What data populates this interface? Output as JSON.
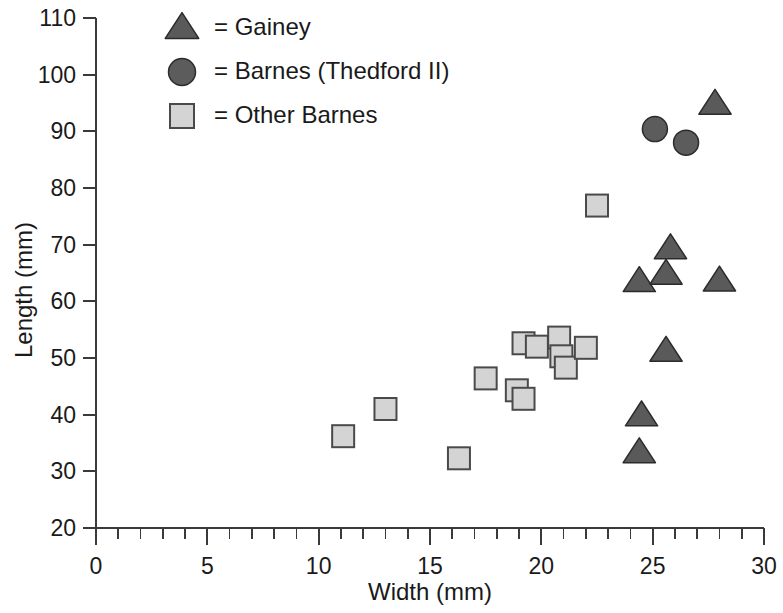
{
  "chart_data": {
    "type": "scatter",
    "title": "",
    "xlabel": "Width (mm)",
    "ylabel": "Length (mm)",
    "xlim": [
      0,
      30
    ],
    "ylim": [
      20,
      110
    ],
    "xticks": [
      0,
      5,
      10,
      15,
      20,
      25,
      30
    ],
    "yticks": [
      20,
      30,
      40,
      50,
      60,
      70,
      80,
      90,
      100,
      110
    ],
    "x_minor_tick_step": 1,
    "grid": false,
    "legend_position": "top-left-inside",
    "series": [
      {
        "name": "Gainey",
        "marker": "triangle",
        "color": "#5a5a5a",
        "edge_color": "#2b2b2b",
        "points": [
          {
            "x": 24.5,
            "y": 39.8
          },
          {
            "x": 24.4,
            "y": 33.3
          },
          {
            "x": 25.6,
            "y": 51.2
          },
          {
            "x": 24.4,
            "y": 63.5
          },
          {
            "x": 25.6,
            "y": 64.8
          },
          {
            "x": 25.8,
            "y": 69.3
          },
          {
            "x": 28.0,
            "y": 63.6
          },
          {
            "x": 27.8,
            "y": 94.8
          }
        ]
      },
      {
        "name": "Barnes (Thedford II)",
        "marker": "circle",
        "color": "#5c5c5c",
        "edge_color": "#2b2b2b",
        "points": [
          {
            "x": 25.1,
            "y": 90.4
          },
          {
            "x": 26.5,
            "y": 88.0
          }
        ]
      },
      {
        "name": "Other Barnes",
        "marker": "square",
        "color": "#d4d4d4",
        "edge_color": "#4a4a4a",
        "points": [
          {
            "x": 11.1,
            "y": 36.2
          },
          {
            "x": 13.0,
            "y": 41.0
          },
          {
            "x": 16.3,
            "y": 32.3
          },
          {
            "x": 17.5,
            "y": 46.4
          },
          {
            "x": 18.9,
            "y": 44.3
          },
          {
            "x": 19.2,
            "y": 42.8
          },
          {
            "x": 19.2,
            "y": 52.6
          },
          {
            "x": 19.8,
            "y": 52.0
          },
          {
            "x": 20.8,
            "y": 53.6
          },
          {
            "x": 20.9,
            "y": 50.3
          },
          {
            "x": 21.1,
            "y": 48.3
          },
          {
            "x": 22.0,
            "y": 51.8
          },
          {
            "x": 22.5,
            "y": 76.9
          }
        ]
      }
    ],
    "legend": [
      {
        "marker": "triangle",
        "label": "= Gainey"
      },
      {
        "marker": "circle",
        "label": "= Barnes (Thedford II)"
      },
      {
        "marker": "square",
        "label": "= Other Barnes"
      }
    ]
  },
  "axes": {
    "y_title": "Length (mm)",
    "x_title": "Width (mm)",
    "y_tick_labels": [
      "110",
      "100",
      "90",
      "80",
      "70",
      "60",
      "50",
      "40",
      "30",
      "20"
    ],
    "x_tick_labels": [
      "0",
      "5",
      "10",
      "15",
      "20",
      "25",
      "30"
    ]
  },
  "legend": {
    "items": [
      {
        "label": "= Gainey",
        "icon": "triangle-marker-icon"
      },
      {
        "label": "= Barnes (Thedford II)",
        "icon": "circle-marker-icon"
      },
      {
        "label": "= Other Barnes",
        "icon": "square-marker-icon"
      }
    ]
  }
}
